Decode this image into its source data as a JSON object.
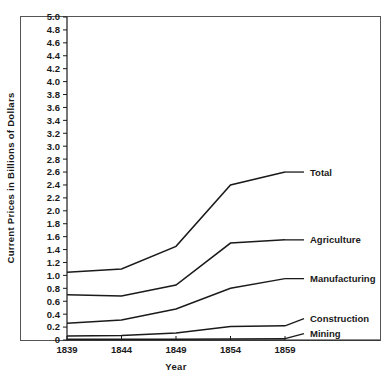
{
  "chart_data": {
    "type": "line",
    "title": "",
    "xlabel": "Year",
    "ylabel": "Current Prices in Billions of Dollars",
    "x": [
      1839,
      1844,
      1849,
      1854,
      1859
    ],
    "xtick_labels": [
      "1839",
      "1844",
      "1849",
      "1854",
      "1859"
    ],
    "xlim": [
      1839,
      1859
    ],
    "ylim": [
      0,
      5.0
    ],
    "ytick_labels": [
      "0",
      "0.2",
      "0.4",
      "0.6",
      "0.8",
      "1.0",
      "1.2",
      "1.4",
      "1.6",
      "1.8",
      "2.0",
      "2.2",
      "2.4",
      "2.6",
      "2.8",
      "3.0",
      "3.2",
      "3.4",
      "3.6",
      "3.8",
      "4.0",
      "4.2",
      "4.4",
      "4.6",
      "4.8",
      "5.0"
    ],
    "ytick_values": [
      0,
      0.2,
      0.4,
      0.6,
      0.8,
      1.0,
      1.2,
      1.4,
      1.6,
      1.8,
      2.0,
      2.2,
      2.4,
      2.6,
      2.8,
      3.0,
      3.2,
      3.4,
      3.6,
      3.8,
      4.0,
      4.2,
      4.4,
      4.6,
      4.8,
      5.0
    ],
    "grid": false,
    "legend_position": "right-inline-labels",
    "line_color": "#1a1a1a",
    "series": [
      {
        "name": "Total",
        "values": [
          1.05,
          1.1,
          1.45,
          2.4,
          2.6
        ]
      },
      {
        "name": "Agriculture",
        "values": [
          0.7,
          0.68,
          0.85,
          1.5,
          1.55
        ]
      },
      {
        "name": "Manufacturing",
        "values": [
          0.26,
          0.31,
          0.48,
          0.8,
          0.95
        ]
      },
      {
        "name": "Construction",
        "values": [
          0.06,
          0.07,
          0.11,
          0.21,
          0.22
        ]
      },
      {
        "name": "Mining",
        "values": [
          0.01,
          0.01,
          0.01,
          0.015,
          0.02
        ]
      }
    ],
    "series_label_positions": [
      {
        "name": "Total",
        "label_y": 2.6
      },
      {
        "name": "Agriculture",
        "label_y": 1.55
      },
      {
        "name": "Manufacturing",
        "label_y": 0.95
      },
      {
        "name": "Construction",
        "label_y": 0.33
      },
      {
        "name": "Mining",
        "label_y": 0.1
      }
    ]
  }
}
